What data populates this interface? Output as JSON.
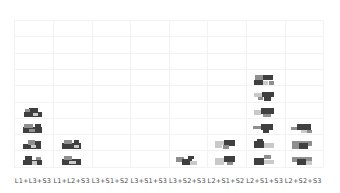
{
  "figure": {
    "background": "#ffffff",
    "grid_color": "#f2f2f2",
    "label_color": "#4a4a4a"
  },
  "palette": {
    "d": "#3f3f3f",
    "m": "#8f8f8f",
    "l": "#c9c9c9",
    "w": "#ffffff"
  },
  "chart_data": {
    "type": "bar",
    "subtype": "pictogram-histogram",
    "title": "",
    "xlabel": "",
    "ylabel": "",
    "categories": [
      "L1+L3+S3",
      "L1+L2+S3",
      "L3+S1+S2",
      "L3+S1+S3",
      "L3+S2+S3",
      "L2+S1+S2",
      "L2+S1+S3",
      "L2+S2+S3"
    ],
    "values": [
      4,
      2,
      0,
      0,
      1,
      2,
      6,
      3
    ],
    "ylim": [
      0,
      9
    ],
    "grid": true,
    "legend": "none",
    "unit_note": "each stacked unit is a small thumbnail image of an assembled block configuration in dark/mid/light gray"
  },
  "thumbnails": {
    "columns": [
      [
        [
          [
            3,
            5,
            18,
            5,
            "d"
          ],
          [
            8,
            1,
            9,
            5,
            "d"
          ],
          [
            12,
            6,
            5,
            3,
            "l"
          ],
          [
            4,
            2,
            5,
            3,
            "m"
          ]
        ],
        [
          [
            2,
            4,
            19,
            6,
            "d"
          ],
          [
            3,
            1,
            9,
            4,
            "m"
          ],
          [
            14,
            1,
            6,
            4,
            "d"
          ],
          [
            8,
            6,
            6,
            3,
            "m"
          ]
        ],
        [
          [
            2,
            5,
            18,
            5,
            "d"
          ],
          [
            7,
            1,
            7,
            5,
            "m"
          ],
          [
            14,
            2,
            6,
            4,
            "d"
          ],
          [
            10,
            6,
            5,
            3,
            "l"
          ]
        ],
        [
          [
            2,
            5,
            19,
            5,
            "d"
          ],
          [
            4,
            1,
            7,
            4,
            "d"
          ],
          [
            11,
            6,
            5,
            4,
            "l"
          ],
          [
            15,
            2,
            5,
            3,
            "m"
          ]
        ]
      ],
      [
        [
          [
            2,
            4,
            19,
            6,
            "d"
          ],
          [
            4,
            1,
            8,
            4,
            "m"
          ],
          [
            14,
            6,
            5,
            3,
            "l"
          ],
          [
            14,
            1,
            5,
            3,
            "d"
          ]
        ],
        [
          [
            2,
            4,
            19,
            6,
            "d"
          ],
          [
            4,
            1,
            8,
            4,
            "m"
          ],
          [
            9,
            6,
            7,
            3,
            "l"
          ]
        ]
      ],
      [],
      [],
      [
        [
          [
            1,
            2,
            8,
            5,
            "m"
          ],
          [
            7,
            4,
            10,
            6,
            "d"
          ],
          [
            15,
            6,
            7,
            4,
            "l"
          ],
          [
            13,
            1,
            6,
            3,
            "d"
          ]
        ]
      ],
      [
        [
          [
            1,
            2,
            10,
            4,
            "l"
          ],
          [
            10,
            1,
            11,
            6,
            "d"
          ],
          [
            9,
            6,
            6,
            4,
            "m"
          ],
          [
            1,
            6,
            7,
            3,
            "l"
          ]
        ],
        [
          [
            1,
            3,
            9,
            7,
            "l"
          ],
          [
            10,
            1,
            11,
            6,
            "d"
          ],
          [
            13,
            7,
            6,
            3,
            "m"
          ]
        ]
      ],
      [
        [
          [
            2,
            0,
            8,
            5,
            "m"
          ],
          [
            10,
            0,
            10,
            5,
            "d"
          ],
          [
            1,
            5,
            9,
            5,
            "d"
          ],
          [
            10,
            6,
            5,
            4,
            "l"
          ],
          [
            16,
            6,
            5,
            4,
            "m"
          ]
        ],
        [
          [
            1,
            2,
            9,
            4,
            "l"
          ],
          [
            9,
            1,
            12,
            5,
            "d"
          ],
          [
            11,
            6,
            7,
            4,
            "d"
          ],
          [
            5,
            6,
            5,
            3,
            "m"
          ]
        ],
        [
          [
            1,
            3,
            7,
            5,
            "l"
          ],
          [
            8,
            1,
            13,
            6,
            "d"
          ],
          [
            10,
            7,
            8,
            3,
            "m"
          ]
        ],
        [
          [
            0,
            3,
            8,
            3,
            "m"
          ],
          [
            8,
            1,
            12,
            6,
            "d"
          ],
          [
            10,
            7,
            6,
            3,
            "d"
          ]
        ],
        [
          [
            1,
            2,
            10,
            7,
            "d"
          ],
          [
            11,
            4,
            10,
            5,
            "l"
          ],
          [
            4,
            0,
            6,
            3,
            "d"
          ]
        ],
        [
          [
            1,
            3,
            10,
            7,
            "d"
          ],
          [
            11,
            5,
            10,
            4,
            "l"
          ],
          [
            11,
            0,
            7,
            4,
            "m"
          ]
        ]
      ],
      [
        [
          [
            0,
            4,
            6,
            3,
            "m"
          ],
          [
            6,
            1,
            14,
            6,
            "d"
          ],
          [
            10,
            7,
            6,
            3,
            "l"
          ],
          [
            16,
            7,
            5,
            3,
            "m"
          ]
        ],
        [
          [
            1,
            2,
            20,
            5,
            "m"
          ],
          [
            8,
            4,
            9,
            6,
            "d"
          ],
          [
            1,
            6,
            7,
            4,
            "m"
          ]
        ],
        [
          [
            1,
            2,
            20,
            5,
            "m"
          ],
          [
            6,
            4,
            9,
            6,
            "d"
          ],
          [
            15,
            6,
            6,
            4,
            "l"
          ]
        ]
      ]
    ]
  }
}
